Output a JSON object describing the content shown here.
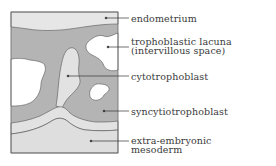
{
  "diagram": {
    "type": "labeled-cross-section",
    "colors": {
      "endometrium": "#e6e6e6",
      "syncytiotrophoblast": "#b4b4b4",
      "lacuna": "#ffffff",
      "cytotrophoblast": "#e2e2e2",
      "mesoderm": "#dedede",
      "outline": "#555555",
      "leader": "#333333"
    },
    "labels": [
      {
        "id": "endometrium",
        "lines": [
          "endometrium"
        ]
      },
      {
        "id": "trophoblastic-lacuna",
        "lines": [
          "trophoblastic lacuna",
          "(intervillous space)"
        ]
      },
      {
        "id": "cytotrophoblast",
        "lines": [
          "cytotrophoblast"
        ]
      },
      {
        "id": "syncytiotrophoblast",
        "lines": [
          "syncytiotrophoblast"
        ]
      },
      {
        "id": "extra-embryonic-mesoderm",
        "lines": [
          "extra-embryonic",
          "mesoderm"
        ]
      }
    ]
  }
}
